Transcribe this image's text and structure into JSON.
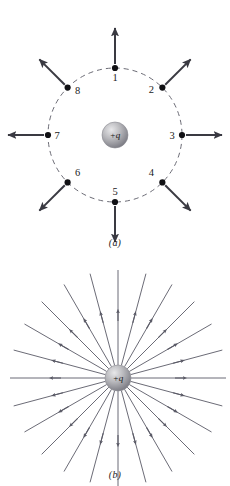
{
  "figure": {
    "background_color": "#ffffff",
    "ink_color": "#3a3a42",
    "label_color": "#1a1a1a",
    "dashed_circle_color": "#6b6b75",
    "field_line_color": "#5a5a66",
    "charge_sphere": {
      "label": "+q",
      "highlight_color": "#e8e8ea",
      "mid_color": "#b9b9bd",
      "edge_color": "#7d7d85",
      "radius": 13
    }
  },
  "panel_a": {
    "caption": "(a)",
    "center": {
      "x": 115,
      "y": 135
    },
    "circle_radius": 67,
    "arrow_length": 36,
    "points": [
      {
        "label": "1",
        "angle_deg": 90,
        "label_dx": 0,
        "label_dy": 13
      },
      {
        "label": "2",
        "angle_deg": 45,
        "label_dx": -11,
        "label_dy": 5
      },
      {
        "label": "3",
        "angle_deg": 0,
        "label_dx": -10,
        "label_dy": 4
      },
      {
        "label": "4",
        "angle_deg": -45,
        "label_dx": -11,
        "label_dy": -6
      },
      {
        "label": "5",
        "angle_deg": -90,
        "label_dx": 0,
        "label_dy": -7
      },
      {
        "label": "6",
        "angle_deg": -135,
        "label_dx": 10,
        "label_dy": -6
      },
      {
        "label": "7",
        "angle_deg": 180,
        "label_dx": 9,
        "label_dy": 4
      },
      {
        "label": "8",
        "angle_deg": 135,
        "label_dx": 10,
        "label_dy": 6
      }
    ]
  },
  "panel_b": {
    "caption": "(b)",
    "center": {
      "x": 118,
      "y": 123
    },
    "line_count": 24,
    "line_start_radius": 13,
    "line_end_radius": 108,
    "arrow_at_radius": 62,
    "charge_label": "+q"
  }
}
